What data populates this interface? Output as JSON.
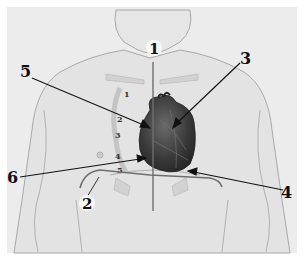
{
  "figure": {
    "colors": {
      "background": "#ffffff",
      "paper": "#ececec",
      "skin_outline": "#9a9a9a",
      "heart": "#3c3c3c",
      "line": "#111111",
      "gray_line": "#6e6e6e"
    },
    "callout_labels": [
      {
        "id": "1",
        "text": "1"
      },
      {
        "id": "2",
        "text": "2"
      },
      {
        "id": "3",
        "text": "3"
      },
      {
        "id": "4",
        "text": "4"
      },
      {
        "id": "5",
        "text": "5"
      },
      {
        "id": "6",
        "text": "6"
      }
    ],
    "rib_labels": [
      "1",
      "2",
      "3",
      "4",
      "5"
    ]
  }
}
